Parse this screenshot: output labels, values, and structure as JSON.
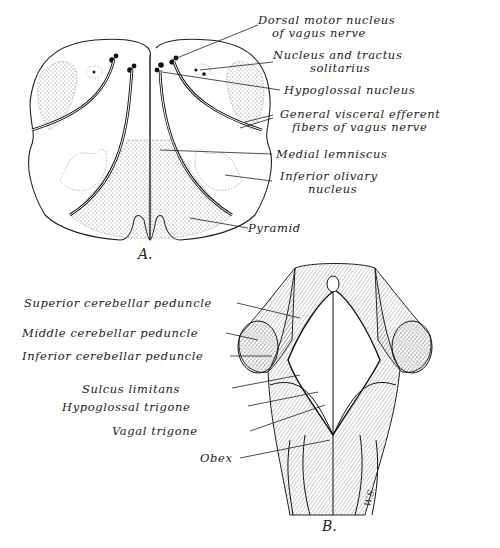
{
  "figure": {
    "panel_a": {
      "letter": "A.",
      "description": "Transverse section of medulla oblongata",
      "labels": {
        "dorsal_motor_1": "Dorsal motor nucleus",
        "dorsal_motor_2": "of vagus nerve",
        "solitarius_1": "Nucleus and tractus",
        "solitarius_2": "solitarius",
        "hypoglossal_nucleus": "Hypoglossal nucleus",
        "gve_1": "General visceral efferent",
        "gve_2": "fibers of vagus nerve",
        "medial_lemniscus": "Medial lemniscus",
        "olivary_1": "Inferior olivary",
        "olivary_2": "nucleus",
        "pyramid": "Pyramid"
      }
    },
    "panel_b": {
      "letter": "B.",
      "description": "Dorsal view of brainstem / floor of fourth ventricle",
      "labels": {
        "superior_peduncle": "Superior cerebellar peduncle",
        "middle_peduncle": "Middle cerebellar peduncle",
        "inferior_peduncle": "Inferior cerebellar peduncle",
        "sulcus_limitans": "Sulcus limitans",
        "hypoglossal_trigone": "Hypoglossal trigone",
        "vagal_trigone": "Vagal trigone",
        "obex": "Obex"
      },
      "signature": "W.S."
    }
  }
}
